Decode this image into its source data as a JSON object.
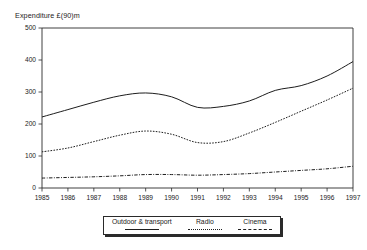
{
  "chart_data": {
    "type": "line",
    "title": "",
    "ylabel": "Expenditure £(90)m",
    "xlabel": "",
    "ylim": [
      0,
      500
    ],
    "yticks": [
      0,
      100,
      200,
      300,
      400,
      500
    ],
    "grid": false,
    "legend_position": "bottom",
    "categories": [
      "1985",
      "1986",
      "1987",
      "1988",
      "1989",
      "1990",
      "1991",
      "1992",
      "1993",
      "1994",
      "1995",
      "1996",
      "1997"
    ],
    "x": [
      1985,
      1986,
      1987,
      1988,
      1989,
      1990,
      1991,
      1992,
      1993,
      1994,
      1995,
      1996,
      1997
    ],
    "series": [
      {
        "name": "Outdoor & transport",
        "style": "solid",
        "color": "#1d1d1d",
        "values": [
          222,
          245,
          268,
          288,
          297,
          285,
          252,
          255,
          272,
          305,
          320,
          350,
          395
        ]
      },
      {
        "name": "Radio",
        "style": "dotted",
        "color": "#1d1d1d",
        "values": [
          113,
          125,
          145,
          165,
          178,
          168,
          142,
          145,
          172,
          205,
          240,
          275,
          312
        ]
      },
      {
        "name": "Cinema",
        "style": "dash-dot",
        "color": "#1d1d1d",
        "values": [
          31,
          33,
          35,
          38,
          42,
          42,
          40,
          42,
          45,
          50,
          55,
          60,
          68
        ]
      }
    ]
  },
  "axis": {
    "y_title": "Expenditure £(90)m",
    "y_tick_labels": [
      "500",
      "400",
      "300",
      "200",
      "100",
      "0"
    ],
    "x_tick_labels": [
      "1985",
      "1986",
      "1987",
      "1988",
      "1989",
      "1990",
      "1991",
      "1992",
      "1993",
      "1994",
      "1995",
      "1996",
      "1997"
    ]
  },
  "legend": {
    "items": [
      {
        "label": "Outdoor & transport",
        "style": "solid"
      },
      {
        "label": "Radio",
        "style": "dotted"
      },
      {
        "label": "Cinema",
        "style": "dash-dot"
      }
    ]
  }
}
